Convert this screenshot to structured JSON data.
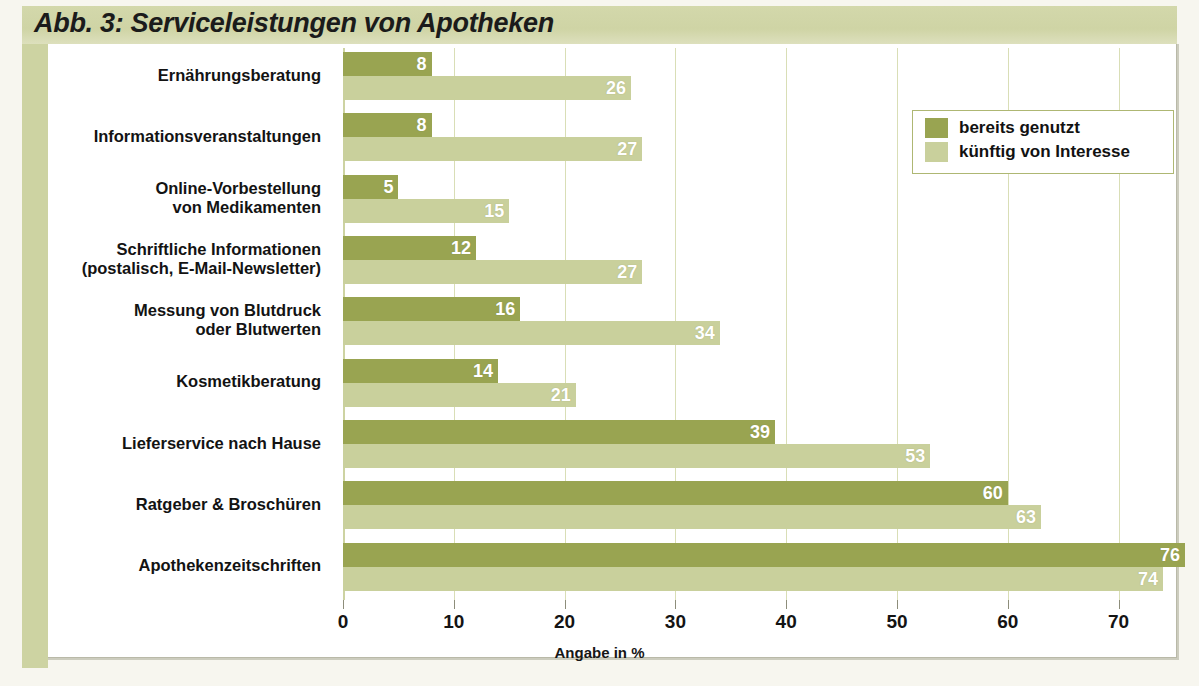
{
  "figure": {
    "title": "Abb. 3: Serviceleistungen von Apotheken"
  },
  "legend": {
    "position": "top-right",
    "items": [
      {
        "label": "bereits genutzt",
        "color": "#99a451",
        "swatch": "legend-swatch-used"
      },
      {
        "label": "künftig von Interesse",
        "color": "#c9d09c",
        "swatch": "legend-swatch-future"
      }
    ]
  },
  "colors": {
    "used": "#99a451",
    "future": "#c9d09c",
    "band": "#cdd3a2",
    "grid": "#d9deb6",
    "canvas": "#ffffff",
    "page": "#f7f6ef"
  },
  "chart_data": {
    "type": "bar",
    "orientation": "horizontal",
    "title": "Abb. 3: Serviceleistungen von Apotheken",
    "xlabel": "Angabe in %",
    "ylabel": "",
    "xlim": [
      0,
      76
    ],
    "xticks": [
      0,
      10,
      20,
      30,
      40,
      50,
      60,
      70
    ],
    "xticklabels": [
      "0",
      "10",
      "20",
      "30",
      "40",
      "50",
      "60",
      "70"
    ],
    "grid": true,
    "grid_axis": "x",
    "legend_position": "upper right",
    "categories": [
      "Ernährungsberatung",
      "Informationsveranstaltungen",
      "Online-Vorbestellung\nvon Medikamenten",
      "Schriftliche  Informationen\n(postalisch, E-Mail-Newsletter)",
      "Messung von Blutdruck\noder Blutwerten",
      "Kosmetikberatung",
      "Lieferservice nach Hause",
      "Ratgeber & Broschüren",
      "Apothekenzeitschriften"
    ],
    "series": [
      {
        "name": "bereits genutzt",
        "color": "#99a451",
        "values": [
          8,
          8,
          5,
          12,
          16,
          14,
          39,
          60,
          76
        ]
      },
      {
        "name": "künftig von Interesse",
        "color": "#c9d09c",
        "values": [
          26,
          27,
          15,
          27,
          34,
          21,
          53,
          63,
          74
        ]
      }
    ]
  }
}
